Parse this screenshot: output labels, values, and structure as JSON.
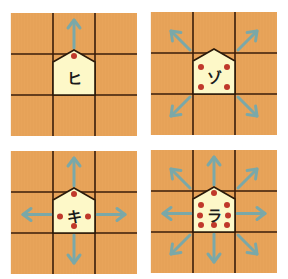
{
  "colors": {
    "board": "#e8a45a",
    "grid_line": "#3a1d0a",
    "piece_fill": "#fdf8c8",
    "piece_stroke": "#2a1a0a",
    "dot": "#c0392b",
    "arrow": "#7aa8a8"
  },
  "boards": [
    {
      "id": "hi",
      "piece_label": "ヒ",
      "position": {
        "x": 11,
        "y": 13
      },
      "moves": [
        "up"
      ],
      "dots": [
        "top"
      ]
    },
    {
      "id": "zo",
      "piece_label": "ゾ",
      "position": {
        "x": 151,
        "y": 12
      },
      "moves": [
        "up-left",
        "up-right",
        "down-left",
        "down-right"
      ],
      "dots": [
        "top-left",
        "top-right",
        "bottom-left",
        "bottom-right"
      ]
    },
    {
      "id": "ki",
      "piece_label": "キ",
      "position": {
        "x": 11,
        "y": 151
      },
      "moves": [
        "up",
        "left",
        "right",
        "down"
      ],
      "dots": [
        "top",
        "left",
        "right",
        "bottom"
      ]
    },
    {
      "id": "ra",
      "piece_label": "ラ",
      "position": {
        "x": 151,
        "y": 150
      },
      "moves": [
        "up",
        "down",
        "left",
        "right",
        "up-left",
        "up-right",
        "down-left",
        "down-right"
      ],
      "dots": [
        "top",
        "bottom",
        "left",
        "right",
        "top-left",
        "top-right",
        "bottom-left",
        "bottom-right"
      ]
    }
  ]
}
